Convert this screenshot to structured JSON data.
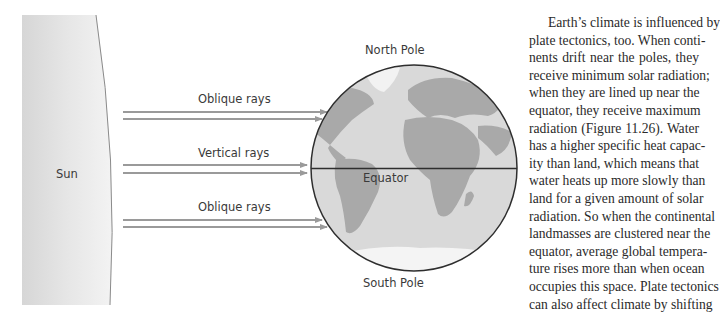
{
  "figure": {
    "sun_label": "Sun",
    "north_pole_label": "North Pole",
    "south_pole_label": "South Pole",
    "equator_label": "Equator",
    "rays": [
      {
        "label": "Oblique rays",
        "kind": "oblique-north"
      },
      {
        "label": "Vertical rays",
        "kind": "vertical"
      },
      {
        "label": "Oblique rays",
        "kind": "oblique-south"
      }
    ],
    "colors": {
      "sun_fill": "#e4e4e4",
      "ocean": "#d9d9d9",
      "land": "#a9a9a9",
      "ice": "#f4f4f4",
      "ray": "#9a9a9a",
      "outline": "#2e2e2e"
    }
  },
  "body_text": {
    "lines": [
      "Earth’s climate is influenced by",
      "plate tectonics, too. When conti-",
      "nents drift near the poles, they",
      "receive minimum solar radiation;",
      "when they are lined up near the",
      "equator, they receive maximum",
      "radiation (Figure 11.26). Water",
      "has a higher specific heat capac-",
      "ity than land, which means that",
      "water heats up more slowly than",
      "land for a given amount of solar",
      "radiation. So when the continental",
      "landmasses are clustered near the",
      "equator, average global tempera-",
      "ture rises more than when ocean",
      "occupies this space. Plate tectonics",
      "can also affect climate by shifting"
    ]
  }
}
